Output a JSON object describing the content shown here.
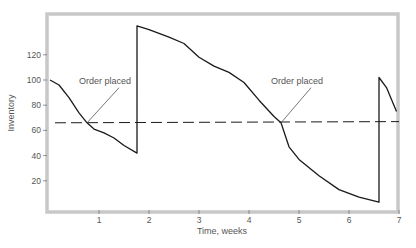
{
  "chart_data": {
    "type": "line",
    "title": "",
    "xlabel": "Time, weeks",
    "ylabel": "Inventory",
    "xlim": [
      0,
      7
    ],
    "ylim": [
      0,
      140
    ],
    "x_ticks": [
      1,
      2,
      3,
      4,
      5,
      6,
      7
    ],
    "y_ticks": [
      20,
      40,
      60,
      80,
      100,
      120
    ],
    "grid": false,
    "legend": null,
    "series": [
      {
        "name": "Inventory level",
        "style": "solid",
        "points": [
          [
            0.02,
            100
          ],
          [
            0.2,
            96
          ],
          [
            0.4,
            86
          ],
          [
            0.6,
            74
          ],
          [
            0.76,
            66
          ],
          [
            0.9,
            61
          ],
          [
            1.1,
            58
          ],
          [
            1.3,
            54
          ],
          [
            1.5,
            48
          ],
          [
            1.76,
            42
          ],
          [
            1.76,
            143
          ],
          [
            2.0,
            140
          ],
          [
            2.4,
            134
          ],
          [
            2.7,
            129
          ],
          [
            3.0,
            118
          ],
          [
            3.3,
            111
          ],
          [
            3.6,
            106
          ],
          [
            3.9,
            98
          ],
          [
            4.2,
            84
          ],
          [
            4.5,
            71
          ],
          [
            4.64,
            66
          ],
          [
            4.8,
            47
          ],
          [
            5.0,
            37
          ],
          [
            5.4,
            24
          ],
          [
            5.8,
            13
          ],
          [
            6.2,
            7
          ],
          [
            6.6,
            3
          ],
          [
            6.6,
            102
          ],
          [
            6.75,
            94
          ],
          [
            6.95,
            75
          ]
        ]
      },
      {
        "name": "Reorder point",
        "style": "dashed",
        "points": [
          [
            0.12,
            66
          ],
          [
            7.0,
            67
          ]
        ]
      }
    ],
    "annotations": [
      {
        "text": "Order placed",
        "x": 0.76,
        "y": 66,
        "label_pos": [
          1.12,
          97
        ]
      },
      {
        "text": "Order placed",
        "x": 4.64,
        "y": 66,
        "label_pos": [
          4.96,
          97
        ]
      }
    ]
  },
  "labels": {
    "xlabel": "Time, weeks",
    "ylabel": "Inventory",
    "annotation_1": "Order placed",
    "annotation_2": "Order placed",
    "x_ticks": [
      "1",
      "2",
      "3",
      "4",
      "5",
      "6",
      "7"
    ],
    "y_ticks": [
      "20",
      "40",
      "60",
      "80",
      "100",
      "120"
    ]
  },
  "colors": {
    "frame": "#c8c8c8",
    "line": "#1a1a1a",
    "text": "#555555"
  }
}
